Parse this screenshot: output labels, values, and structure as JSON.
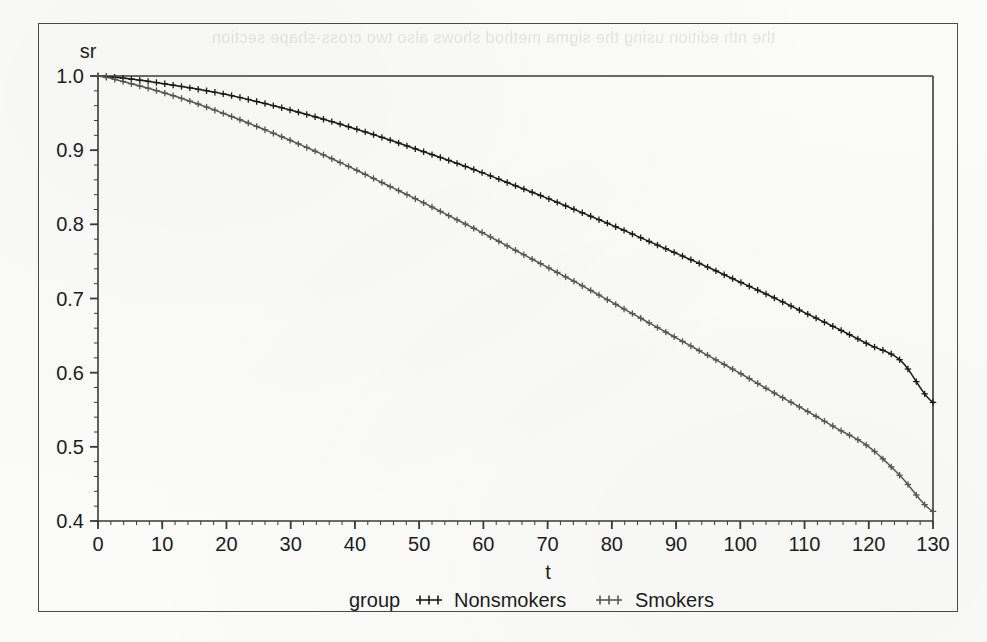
{
  "figure": {
    "background_paper_color": "#fbfbfa",
    "frame_color": "#4a4a4a",
    "bleed_through_text": "the nth edition using the sigma method shows also two cross-shape section"
  },
  "chart_data": {
    "type": "line",
    "title": "",
    "subtitle": "",
    "xlabel": "t",
    "ylabel": "sr",
    "xlim": [
      0,
      130
    ],
    "ylim": [
      0.4,
      1.0
    ],
    "grid": false,
    "legend_position": "bottom",
    "legend_title": "group",
    "x_ticks": [
      0,
      10,
      20,
      30,
      40,
      50,
      60,
      70,
      80,
      90,
      100,
      110,
      120,
      130
    ],
    "x_tick_labels": [
      "0",
      "10",
      "20",
      "30",
      "40",
      "50",
      "60",
      "70",
      "80",
      "90",
      "100",
      "110",
      "120",
      "130"
    ],
    "x_minor_tick_interval": 2,
    "y_ticks": [
      0.4,
      0.5,
      0.6,
      0.7,
      0.8,
      0.9,
      1.0
    ],
    "y_tick_labels": [
      "0.4",
      "0.5",
      "0.6",
      "0.7",
      "0.8",
      "0.9",
      "1.0"
    ],
    "y_minor_tick_interval": 0.02,
    "marker": "plus",
    "series": [
      {
        "name": "Nonsmokers",
        "color": "#1a1a1a",
        "marker": "plus",
        "x": [
          0,
          5,
          10,
          15,
          20,
          25,
          30,
          35,
          40,
          45,
          50,
          55,
          60,
          65,
          70,
          75,
          80,
          85,
          90,
          95,
          100,
          105,
          110,
          115,
          120,
          125,
          130
        ],
        "values": [
          1.0,
          0.996,
          0.99,
          0.983,
          0.975,
          0.965,
          0.954,
          0.942,
          0.929,
          0.915,
          0.9,
          0.885,
          0.869,
          0.852,
          0.835,
          0.817,
          0.799,
          0.78,
          0.761,
          0.742,
          0.722,
          0.702,
          0.681,
          0.66,
          0.638,
          0.616,
          0.56
        ]
      },
      {
        "name": "Smokers",
        "color": "#555555",
        "marker": "plus",
        "x": [
          0,
          5,
          10,
          15,
          20,
          25,
          30,
          35,
          40,
          45,
          50,
          55,
          60,
          65,
          70,
          75,
          80,
          85,
          90,
          95,
          100,
          105,
          110,
          115,
          120,
          125,
          130
        ],
        "values": [
          1.0,
          0.99,
          0.978,
          0.964,
          0.948,
          0.931,
          0.913,
          0.894,
          0.874,
          0.853,
          0.832,
          0.81,
          0.788,
          0.765,
          0.742,
          0.719,
          0.695,
          0.671,
          0.647,
          0.623,
          0.599,
          0.574,
          0.55,
          0.525,
          0.5,
          0.46,
          0.413
        ]
      }
    ]
  }
}
